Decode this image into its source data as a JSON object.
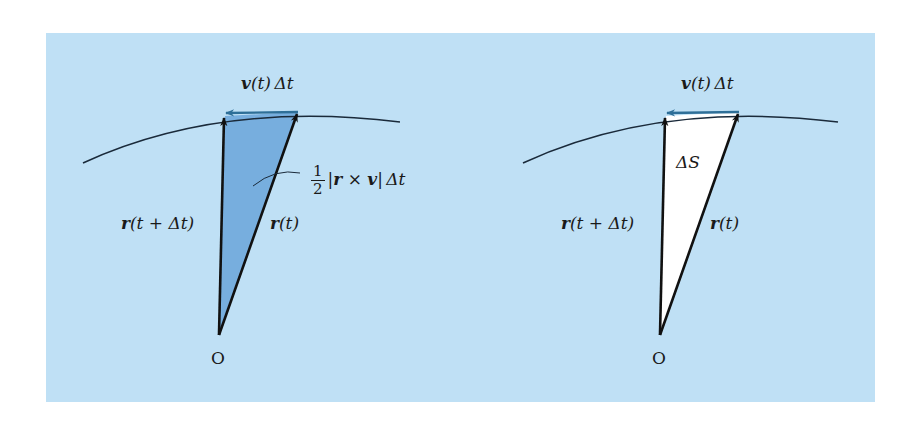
{
  "figure": {
    "background_color": "#bfe0f5",
    "shaded_area_color": "#6fa8dc",
    "unshaded_area_color": "#ffffff",
    "velocity_arrow_color": "#2e6f98",
    "line_color": "#111111"
  },
  "left_panel": {
    "velocity_label": {
      "vec": "v",
      "rest": "(t) Δt"
    },
    "area_label": {
      "frac_num": "1",
      "frac_den": "2",
      "expr_pre": "|",
      "vec1": "r",
      "times": " × ",
      "vec2": "v",
      "expr_post": "| Δt"
    },
    "r_t_dt_label": {
      "vec": "r",
      "rest": "(t + Δt)"
    },
    "r_t_label": {
      "vec": "r",
      "rest": "(t)"
    },
    "origin_label": "O"
  },
  "right_panel": {
    "velocity_label": {
      "vec": "v",
      "rest": "(t) Δt"
    },
    "area_label": "ΔS",
    "r_t_dt_label": {
      "vec": "r",
      "rest": "(t + Δt)"
    },
    "r_t_label": {
      "vec": "r",
      "rest": "(t)"
    },
    "origin_label": "O"
  }
}
